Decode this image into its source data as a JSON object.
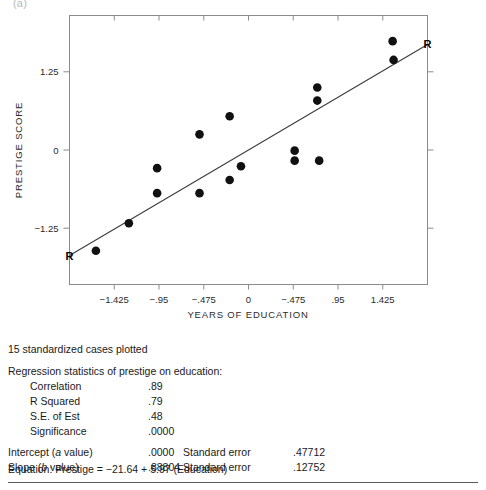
{
  "figure": {
    "panel_letter": "(a)",
    "caption_note": "15 standardized cases plotted"
  },
  "chart_data": {
    "type": "scatter",
    "title": "",
    "xlabel": "YEARS OF EDUCATION",
    "ylabel": "PRESTIGE SCORE",
    "grid": false,
    "legend": false,
    "xlim": [
      -1.9,
      1.9
    ],
    "ylim": [
      -2.15,
      2.15
    ],
    "xticks": [
      -1.425,
      -0.95,
      -0.475,
      0,
      0.475,
      0.95,
      1.425
    ],
    "xtick_labels": [
      "−1.425",
      "−.95",
      "−.475",
      "0",
      "−.475",
      ".95",
      "1.425"
    ],
    "yticks": [
      1.25,
      0,
      -1.25
    ],
    "ytick_labels": [
      "1.25",
      "0",
      "−1.25"
    ],
    "y_minor_ticks_right": [
      1.25,
      0,
      -1.25
    ],
    "point_color": "#111111",
    "line_color": "#3c3c3c",
    "points": [
      {
        "x": -1.62,
        "y": -1.61
      },
      {
        "x": -1.27,
        "y": -1.17
      },
      {
        "x": -0.97,
        "y": -0.69
      },
      {
        "x": -0.97,
        "y": -0.29
      },
      {
        "x": -0.52,
        "y": -0.69
      },
      {
        "x": -0.52,
        "y": 0.25
      },
      {
        "x": -0.2,
        "y": -0.48
      },
      {
        "x": -0.2,
        "y": 0.54
      },
      {
        "x": -0.08,
        "y": -0.26
      },
      {
        "x": 0.49,
        "y": -0.01
      },
      {
        "x": 0.49,
        "y": -0.17
      },
      {
        "x": 0.73,
        "y": 1.0
      },
      {
        "x": 0.73,
        "y": 0.79
      },
      {
        "x": 0.75,
        "y": -0.17
      },
      {
        "x": 1.53,
        "y": 1.74
      },
      {
        "x": 1.54,
        "y": 1.44
      }
    ],
    "regression_line": {
      "label_left": "R",
      "label_right": "R",
      "x_start": -1.9,
      "x_end": 1.9,
      "slope": 0.88804,
      "intercept": 0.0
    }
  },
  "stats": {
    "cases_plotted": "15 standardized cases plotted",
    "heading": "Regression statistics of prestige on education:",
    "rows": [
      {
        "label": "Correlation",
        "value": ".89"
      },
      {
        "label": "R Squared",
        "value": ".79"
      },
      {
        "label": "S.E. of Est",
        "value": ".48"
      },
      {
        "label": "Significance",
        "value": ".0000"
      }
    ],
    "intercept": {
      "label_pre": "Intercept (",
      "label_ital": "a",
      "label_post": " value)",
      "value": ".0000",
      "se_label": "Standard error",
      "se_value": ".47712"
    },
    "slope": {
      "label_pre": "Slope (",
      "label_ital": "b",
      "label_post": " value)",
      "value": ".88804",
      "se_label": "Standard error",
      "se_value": ".12752"
    },
    "equation": "Equation: Prestige = −21.64 + 5.97 (Education)"
  }
}
